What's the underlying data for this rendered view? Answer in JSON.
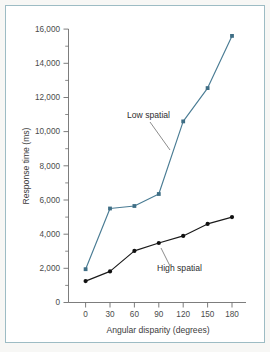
{
  "figure": {
    "frame_color": "#9dbcc4",
    "background": "#ffffff"
  },
  "chart_data": {
    "type": "line",
    "title": "",
    "xlabel": "Angular disparity (degrees)",
    "ylabel": "Response time (ms)",
    "x": [
      0,
      30,
      60,
      90,
      120,
      150,
      180
    ],
    "xlim": [
      -10,
      195
    ],
    "ylim": [
      0,
      16000
    ],
    "xticks": [
      0,
      30,
      60,
      90,
      120,
      150,
      180
    ],
    "xtick_labels": [
      "0",
      "30",
      "60",
      "90",
      "120",
      "150",
      "180"
    ],
    "yticks": [
      0,
      2000,
      4000,
      6000,
      8000,
      10000,
      12000,
      14000,
      16000
    ],
    "ytick_labels": [
      "0",
      "2,000",
      "4,000",
      "6,000",
      "8,000",
      "10,000",
      "12,000",
      "14,000",
      "16,000"
    ],
    "y_minor_ticks": [
      1000,
      3000,
      5000,
      7000,
      9000,
      11000,
      13000,
      15000
    ],
    "grid": false,
    "legend_position": "inline-annotations",
    "series": [
      {
        "name": "Low spatial",
        "color": "#4a7c94",
        "marker": "square",
        "values": [
          1950,
          5500,
          5650,
          6350,
          10600,
          12550,
          15600
        ],
        "annotation": {
          "text": "Low spatial",
          "x": 52,
          "y": 11200
        }
      },
      {
        "name": "High spatial",
        "color": "#1a1a1a",
        "marker": "circle",
        "values": [
          1250,
          1820,
          3020,
          3480,
          3900,
          4600,
          5000
        ],
        "annotation": {
          "text": "High spatial",
          "x": 133,
          "y": 2750
        }
      }
    ]
  }
}
